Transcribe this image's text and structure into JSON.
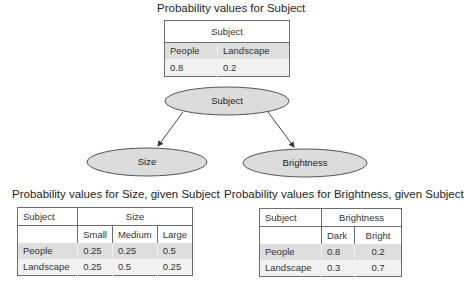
{
  "subject_table": {
    "title": "Probability values for Subject",
    "header": "Subject",
    "columns": [
      "People",
      "Landscape"
    ],
    "values": [
      "0.8",
      "0.2"
    ]
  },
  "network": {
    "nodes": [
      {
        "id": "subject",
        "label": "Subject"
      },
      {
        "id": "size",
        "label": "Size"
      },
      {
        "id": "brightness",
        "label": "Brightness"
      }
    ],
    "edges": [
      {
        "from": "subject",
        "to": "size"
      },
      {
        "from": "subject",
        "to": "brightness"
      }
    ],
    "node_fill": "#dcdcdc",
    "node_stroke": "#555555"
  },
  "size_table": {
    "title": "Probability values for Size, given Subject",
    "row_header": "Subject",
    "group_header": "Size",
    "columns": [
      "Small",
      "Medium",
      "Large"
    ],
    "rows": [
      {
        "label": "People",
        "values": [
          "0.25",
          "0.25",
          "0.5"
        ]
      },
      {
        "label": "Landscape",
        "values": [
          "0.25",
          "0.5",
          "0.25"
        ]
      }
    ]
  },
  "brightness_table": {
    "title": "Probability values for Brightness, given Subject",
    "row_header": "Subject",
    "group_header": "Brightness",
    "columns": [
      "Dark",
      "Bright"
    ],
    "rows": [
      {
        "label": "People",
        "values": [
          "0.8",
          "0.2"
        ]
      },
      {
        "label": "Landscape",
        "values": [
          "0.3",
          "0.7"
        ]
      }
    ]
  }
}
